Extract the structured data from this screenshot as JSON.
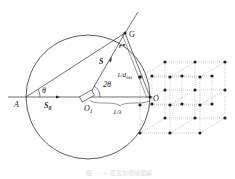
{
  "diagram": {
    "type": "ewald-sphere-diffraction",
    "labels": {
      "A": "A",
      "G": "G",
      "O": "O",
      "O1": "O",
      "O1_sub": "1",
      "S": "S",
      "S0": "S",
      "S0_sub": "0",
      "r_star": "r*",
      "d_hkl": "1/d",
      "d_hkl_sub": "hkl",
      "theta": "θ",
      "two_theta": "2θ",
      "inv_lambda": "1/λ"
    },
    "caption": "图 — — 厄瓦尔德球图解"
  }
}
